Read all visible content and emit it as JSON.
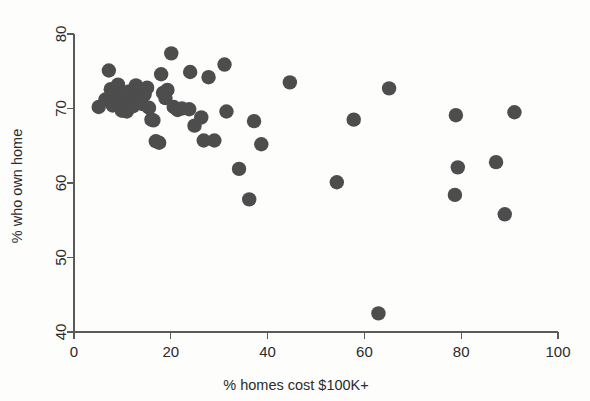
{
  "chart_data": {
    "type": "scatter",
    "title": "",
    "xlabel": "% homes cost $100K+",
    "ylabel": "% who own home",
    "xlim": [
      0,
      100
    ],
    "ylim": [
      40,
      80
    ],
    "xticks": [
      0,
      20,
      40,
      60,
      80,
      100
    ],
    "yticks": [
      40,
      50,
      60,
      70,
      80
    ],
    "grid": false,
    "legend": null,
    "marker": {
      "shape": "circle",
      "color": "#4d4d4d",
      "size": 7.2
    },
    "n_points": 53,
    "points": [
      {
        "x": 5.1,
        "y": 70.2
      },
      {
        "x": 6.5,
        "y": 71.2
      },
      {
        "x": 7.2,
        "y": 75.1
      },
      {
        "x": 7.6,
        "y": 72.6
      },
      {
        "x": 8.0,
        "y": 70.4
      },
      {
        "x": 8.4,
        "y": 71.6
      },
      {
        "x": 9.1,
        "y": 73.2
      },
      {
        "x": 9.5,
        "y": 71.0
      },
      {
        "x": 9.9,
        "y": 69.7
      },
      {
        "x": 10.3,
        "y": 72.0
      },
      {
        "x": 10.9,
        "y": 69.6
      },
      {
        "x": 11.4,
        "y": 72.3
      },
      {
        "x": 11.8,
        "y": 71.1
      },
      {
        "x": 12.2,
        "y": 70.3
      },
      {
        "x": 12.8,
        "y": 73.1
      },
      {
        "x": 13.2,
        "y": 72.4
      },
      {
        "x": 13.7,
        "y": 71.3
      },
      {
        "x": 14.1,
        "y": 70.6
      },
      {
        "x": 14.6,
        "y": 71.9
      },
      {
        "x": 15.1,
        "y": 72.8
      },
      {
        "x": 15.5,
        "y": 70.1
      },
      {
        "x": 16.0,
        "y": 68.5
      },
      {
        "x": 16.4,
        "y": 68.4
      },
      {
        "x": 16.9,
        "y": 65.6
      },
      {
        "x": 17.6,
        "y": 65.4
      },
      {
        "x": 18.0,
        "y": 74.6
      },
      {
        "x": 18.4,
        "y": 72.1
      },
      {
        "x": 18.9,
        "y": 71.4
      },
      {
        "x": 19.3,
        "y": 72.5
      },
      {
        "x": 20.1,
        "y": 77.4
      },
      {
        "x": 20.6,
        "y": 70.2
      },
      {
        "x": 21.4,
        "y": 69.8
      },
      {
        "x": 22.3,
        "y": 70.0
      },
      {
        "x": 23.8,
        "y": 69.9
      },
      {
        "x": 24.0,
        "y": 74.9
      },
      {
        "x": 24.9,
        "y": 67.7
      },
      {
        "x": 26.3,
        "y": 68.8
      },
      {
        "x": 26.8,
        "y": 65.7
      },
      {
        "x": 27.8,
        "y": 74.2
      },
      {
        "x": 29.0,
        "y": 65.7
      },
      {
        "x": 31.1,
        "y": 75.9
      },
      {
        "x": 31.5,
        "y": 69.6
      },
      {
        "x": 34.1,
        "y": 61.9
      },
      {
        "x": 36.2,
        "y": 57.8
      },
      {
        "x": 37.2,
        "y": 68.3
      },
      {
        "x": 38.7,
        "y": 65.2
      },
      {
        "x": 44.6,
        "y": 73.5
      },
      {
        "x": 54.3,
        "y": 60.1
      },
      {
        "x": 57.8,
        "y": 68.5
      },
      {
        "x": 62.9,
        "y": 42.5
      },
      {
        "x": 65.1,
        "y": 72.7
      },
      {
        "x": 78.9,
        "y": 69.1
      },
      {
        "x": 79.3,
        "y": 62.1
      },
      {
        "x": 78.7,
        "y": 58.4
      },
      {
        "x": 87.2,
        "y": 62.8
      },
      {
        "x": 89.0,
        "y": 55.8
      },
      {
        "x": 91.0,
        "y": 69.5
      }
    ]
  },
  "axes": {
    "x_title": "% homes cost $100K+",
    "y_title": "% who own home",
    "x_tick_labels": [
      "0",
      "20",
      "40",
      "60",
      "80",
      "100"
    ],
    "y_tick_labels": [
      "40",
      "50",
      "60",
      "70",
      "80"
    ]
  },
  "colors": {
    "marker": "#4d4d4d",
    "axis": "#5a5a5a",
    "text": "#2b2b2b",
    "background": "#fdfdfc"
  }
}
